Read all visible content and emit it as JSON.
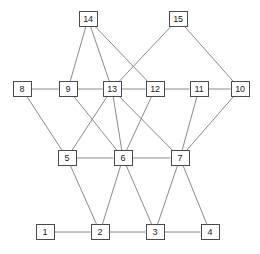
{
  "figure": {
    "background_color": "#ffffff",
    "node_border_color": "#4a4a4a",
    "node_fill_color": "#ffffff",
    "edge_color": "#7d7d7d",
    "label_color": "#1a1a1a",
    "width": 260,
    "height": 254
  },
  "graph_data": {
    "type": "node-link-diagram",
    "directed": false,
    "node_count": 15,
    "edge_count": 28,
    "nodes": [
      {
        "id": "1",
        "label": "1",
        "x": 45,
        "y": 232,
        "row": 4
      },
      {
        "id": "2",
        "label": "2",
        "x": 100,
        "y": 232,
        "row": 4
      },
      {
        "id": "3",
        "label": "3",
        "x": 155,
        "y": 232,
        "row": 4
      },
      {
        "id": "4",
        "label": "4",
        "x": 210,
        "y": 232,
        "row": 4
      },
      {
        "id": "5",
        "label": "5",
        "x": 67,
        "y": 158,
        "row": 3
      },
      {
        "id": "6",
        "label": "6",
        "x": 123,
        "y": 158,
        "row": 3
      },
      {
        "id": "7",
        "label": "7",
        "x": 180,
        "y": 158,
        "row": 3
      },
      {
        "id": "8",
        "label": "8",
        "x": 22,
        "y": 89,
        "row": 2
      },
      {
        "id": "9",
        "label": "9",
        "x": 68,
        "y": 89,
        "row": 2
      },
      {
        "id": "13",
        "label": "13",
        "x": 112,
        "y": 89,
        "row": 2
      },
      {
        "id": "12",
        "label": "12",
        "x": 155,
        "y": 89,
        "row": 2
      },
      {
        "id": "11",
        "label": "11",
        "x": 199,
        "y": 89,
        "row": 2
      },
      {
        "id": "10",
        "label": "10",
        "x": 240,
        "y": 89,
        "row": 2
      },
      {
        "id": "14",
        "label": "14",
        "x": 88,
        "y": 19,
        "row": 1
      },
      {
        "id": "15",
        "label": "15",
        "x": 178,
        "y": 19,
        "row": 1
      }
    ],
    "edges": [
      {
        "source": "14",
        "target": "9"
      },
      {
        "source": "14",
        "target": "13"
      },
      {
        "source": "14",
        "target": "12"
      },
      {
        "source": "15",
        "target": "13"
      },
      {
        "source": "15",
        "target": "10"
      },
      {
        "source": "8",
        "target": "9"
      },
      {
        "source": "9",
        "target": "13"
      },
      {
        "source": "13",
        "target": "12"
      },
      {
        "source": "12",
        "target": "11"
      },
      {
        "source": "11",
        "target": "10"
      },
      {
        "source": "8",
        "target": "5"
      },
      {
        "source": "9",
        "target": "6"
      },
      {
        "source": "13",
        "target": "5"
      },
      {
        "source": "13",
        "target": "6"
      },
      {
        "source": "13",
        "target": "7"
      },
      {
        "source": "12",
        "target": "6"
      },
      {
        "source": "11",
        "target": "7"
      },
      {
        "source": "10",
        "target": "7"
      },
      {
        "source": "5",
        "target": "6"
      },
      {
        "source": "6",
        "target": "7"
      },
      {
        "source": "5",
        "target": "2"
      },
      {
        "source": "6",
        "target": "2"
      },
      {
        "source": "6",
        "target": "3"
      },
      {
        "source": "7",
        "target": "3"
      },
      {
        "source": "7",
        "target": "4"
      },
      {
        "source": "1",
        "target": "2"
      },
      {
        "source": "2",
        "target": "3"
      },
      {
        "source": "3",
        "target": "4"
      }
    ]
  }
}
